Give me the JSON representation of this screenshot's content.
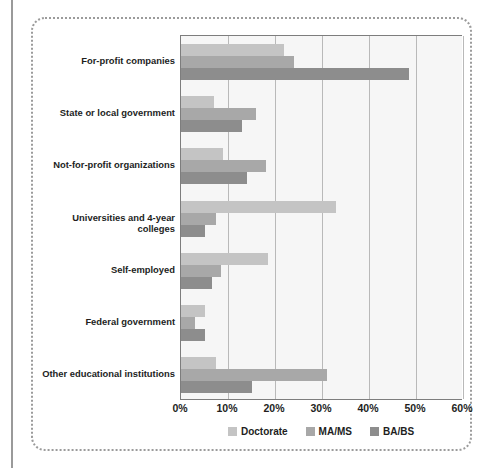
{
  "chart_data": {
    "type": "bar",
    "orientation": "horizontal",
    "title": "",
    "xlabel": "",
    "ylabel": "",
    "xlim": [
      0,
      60
    ],
    "grid": true,
    "legend_position": "bottom",
    "categories": [
      "For-profit companies",
      "State or local government",
      "Not-for-profit organizations",
      "Universities and 4-year colleges",
      "Self-employed",
      "Federal government",
      "Other educational institutions"
    ],
    "series": [
      {
        "name": "Doctorate",
        "color": "#c4c4c4",
        "values": [
          22,
          7,
          9,
          33,
          18.5,
          5,
          7.5
        ]
      },
      {
        "name": "MA/MS",
        "color": "#a8a8a8",
        "values": [
          24,
          16,
          18,
          7.5,
          8.5,
          3,
          31
        ]
      },
      {
        "name": "BA/BS",
        "color": "#8d8d8d",
        "values": [
          48.5,
          13,
          14,
          5,
          6.5,
          5,
          15
        ]
      }
    ],
    "x_ticks": [
      0,
      10,
      20,
      30,
      40,
      50,
      60
    ],
    "x_tick_labels": [
      "0%",
      "10%",
      "20%",
      "30%",
      "40%",
      "50%",
      "60%"
    ]
  },
  "legend": {
    "items": [
      {
        "label": "Doctorate",
        "swatch": "doctorate"
      },
      {
        "label": "MA/MS",
        "swatch": "mams"
      },
      {
        "label": "BA/BS",
        "swatch": "babs"
      }
    ]
  },
  "colors": {
    "doctorate": "#c4c4c4",
    "mams": "#a8a8a8",
    "babs": "#8d8d8d",
    "plot_background": "#f6f6f6",
    "gridline": "#b9b9b9",
    "axis": "#7d7d7d",
    "frame_border": "#9b9b9b",
    "text": "#221e1d"
  }
}
